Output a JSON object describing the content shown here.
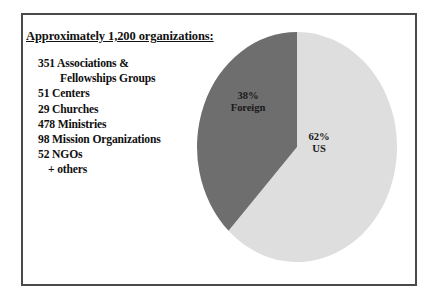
{
  "slide": {
    "heading": "Approximately 1,200 organizations:",
    "org_list": [
      {
        "text": "351 Associations &",
        "indent": "none"
      },
      {
        "text": "Fellowships Groups",
        "indent": "large"
      },
      {
        "text": "51 Centers",
        "indent": "none"
      },
      {
        "text": "29 Churches",
        "indent": "none"
      },
      {
        "text": "478 Ministries",
        "indent": "none"
      },
      {
        "text": "98 Mission Organizations",
        "indent": "none"
      },
      {
        "text": "52 NGOs",
        "indent": "none"
      },
      {
        "text": "+ others",
        "indent": "small"
      }
    ]
  },
  "chart_data": {
    "type": "pie",
    "title": "Approximately 1,200 organizations:",
    "categories": [
      "Foreign",
      "US"
    ],
    "values": [
      38,
      62
    ],
    "value_unit": "%",
    "labels": [
      "38%\nForeign",
      "62%\nUS"
    ],
    "colors": [
      "#6e6e6e",
      "#dedede"
    ],
    "legend": "none",
    "start_angle_deg": 90,
    "direction": "counterclockwise",
    "slices": [
      {
        "name": "Foreign",
        "percent": 38,
        "percent_label": "38%",
        "name_label": "Foreign",
        "color": "#6e6e6e"
      },
      {
        "name": "US",
        "percent": 62,
        "percent_label": "62%",
        "name_label": "US",
        "color": "#dedede"
      }
    ]
  },
  "colors": {
    "frame_border": "#4a4a4a",
    "background": "#ffffff",
    "text": "#101010",
    "slice_foreign": "#6e6e6e",
    "slice_us": "#dedede"
  }
}
